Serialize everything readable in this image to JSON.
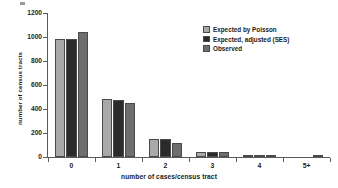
{
  "chart_data": {
    "type": "bar",
    "title": "",
    "xlabel": "number of cases/census tract",
    "ylabel": "number of census tracts",
    "categories": [
      "0",
      "1",
      "2",
      "3",
      "4",
      "5+"
    ],
    "series": [
      {
        "name": "Expected by Poisson",
        "color": "#a9a9a9",
        "values": [
          980,
          480,
          150,
          40,
          3,
          0
        ]
      },
      {
        "name": "Expected, adjusted (SES)",
        "color": "#2b2b2b",
        "values": [
          982,
          475,
          150,
          42,
          3,
          0
        ]
      },
      {
        "name": "Observed",
        "color": "#6e6e6e",
        "values": [
          1045,
          450,
          115,
          42,
          4,
          2
        ]
      }
    ],
    "ylim": [
      0,
      1200
    ],
    "yticks": [
      0,
      200,
      400,
      600,
      800,
      1000,
      1200
    ],
    "grid": false,
    "legend_position": "top-right"
  },
  "colors": {
    "axis": "#5a5a5a",
    "text": "#1a1a1a",
    "background": "#ffffff"
  }
}
